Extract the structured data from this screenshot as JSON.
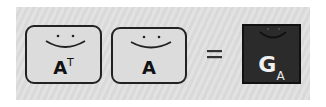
{
  "diagram": {
    "colors": {
      "panel_background": "#dedede",
      "box_fill": "#dcdcdc",
      "box_border": "#222222",
      "result_fill": "#2b2b2b",
      "result_text": "#f0f0f0"
    },
    "terms": [
      {
        "id": "a-transpose",
        "base": "A",
        "superscript": "T",
        "style": "light"
      },
      {
        "id": "a",
        "base": "A",
        "style": "light"
      }
    ],
    "operator": "=",
    "result": {
      "id": "gram-matrix",
      "base": "G",
      "subscript": "A",
      "style": "dark"
    }
  }
}
